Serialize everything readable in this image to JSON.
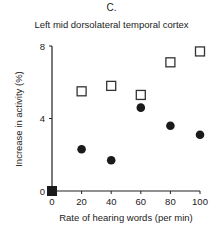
{
  "panel_label": "C.",
  "chart_data": {
    "type": "scatter",
    "title": "Left mid dorsolateral temporal cortex",
    "xlabel": "Rate of hearing words (per min)",
    "ylabel": "Increase in activity (%)",
    "xlim": [
      0,
      100
    ],
    "ylim": [
      0,
      8
    ],
    "x_ticks": [
      0,
      20,
      40,
      60,
      80,
      100
    ],
    "y_ticks": [
      0,
      4,
      8
    ],
    "grid": false,
    "legend": null,
    "series": [
      {
        "name": "open squares",
        "marker": "open-square",
        "x": [
          20,
          40,
          60,
          80,
          100
        ],
        "values": [
          5.5,
          5.8,
          5.3,
          7.1,
          7.7
        ]
      },
      {
        "name": "filled circles",
        "marker": "filled-circle",
        "x": [
          20,
          40,
          60,
          80,
          100
        ],
        "values": [
          2.3,
          1.7,
          4.6,
          3.6,
          3.1
        ]
      },
      {
        "name": "baseline",
        "marker": "filled-square",
        "x": [
          0
        ],
        "values": [
          0
        ]
      }
    ]
  }
}
